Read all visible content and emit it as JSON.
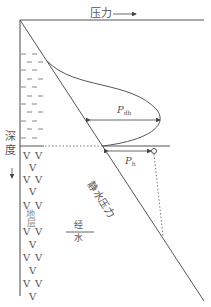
{
  "diagram": {
    "x_axis_label": "压力",
    "y_axis_label_chars": [
      "深",
      "度"
    ],
    "layer_label_chars": [
      "地",
      "层"
    ],
    "fraction_top": "经",
    "fraction_bottom": "水",
    "line_label": "静水压力",
    "p_dh": {
      "symbol": "P",
      "subscript": "dh"
    },
    "p_h": {
      "symbol": "P",
      "subscript": "h"
    },
    "mud_symbol": "—",
    "rock_symbol": "V",
    "colors": {
      "line": "#555555",
      "text": "#555555",
      "background": "#ffffff"
    }
  }
}
